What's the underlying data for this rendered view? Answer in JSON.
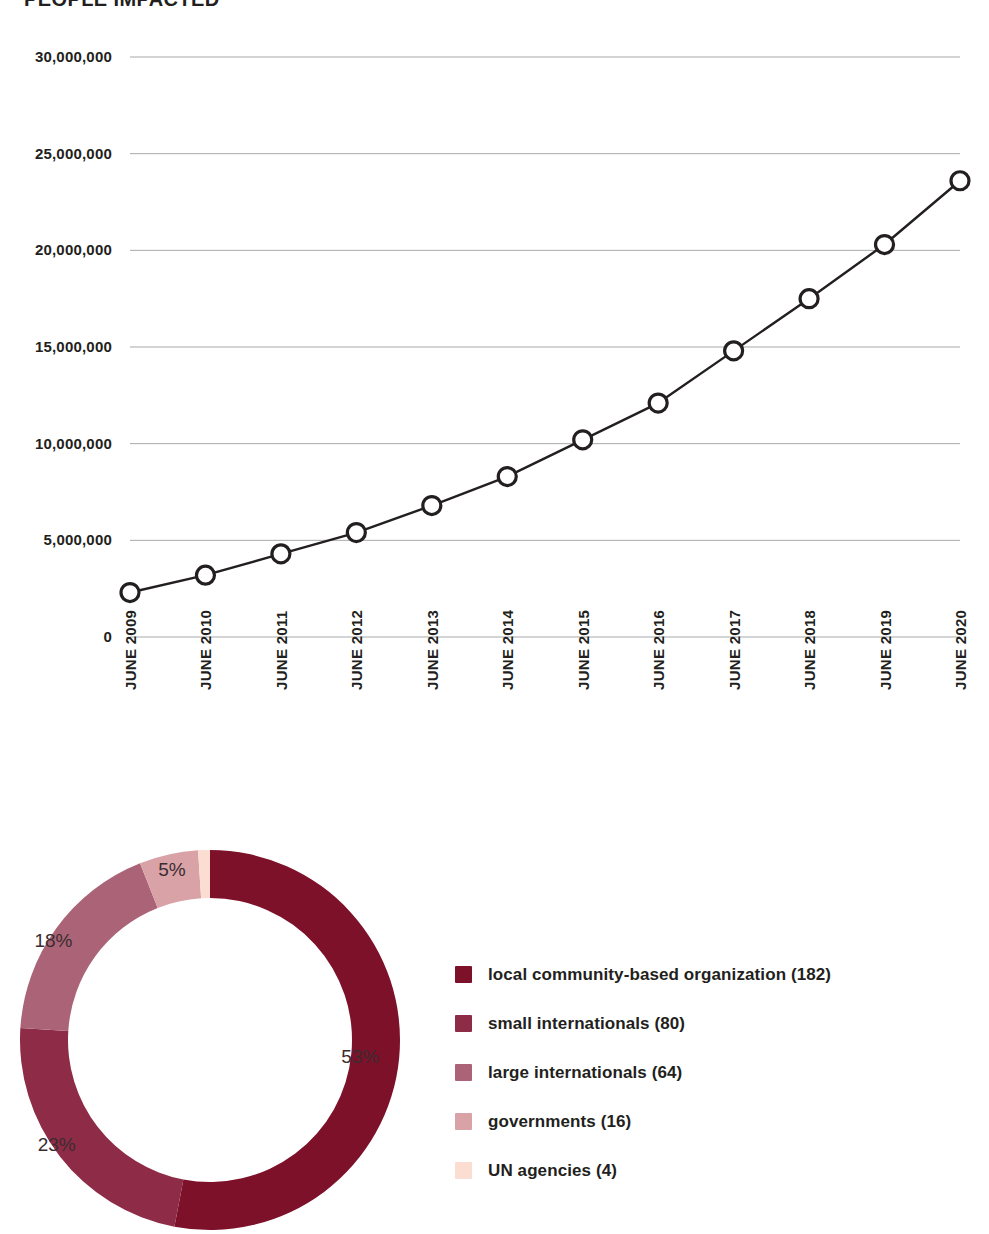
{
  "title": "PEOPLE IMPACTED",
  "chart_data": [
    {
      "type": "line",
      "title": "PEOPLE IMPACTED",
      "xlabel": "",
      "ylabel": "",
      "grid": true,
      "legend_position": "none",
      "ylim": [
        0,
        30000000
      ],
      "categories": [
        "JUNE 2009",
        "JUNE 2010",
        "JUNE 2011",
        "JUNE 2012",
        "JUNE 2013",
        "JUNE 2014",
        "JUNE 2015",
        "JUNE 2016",
        "JUNE 2017",
        "JUNE 2018",
        "JUNE 2019",
        "JUNE 2020"
      ],
      "ytick_labels": [
        "30,000,000",
        "25,000,000",
        "20,000,000",
        "15,000,000",
        "10,000,000",
        "5,000,000",
        "0"
      ],
      "ytick_values": [
        30000000,
        25000000,
        20000000,
        15000000,
        10000000,
        5000000,
        0
      ],
      "values": [
        2300000,
        3200000,
        4300000,
        5400000,
        6800000,
        8300000,
        10200000,
        12100000,
        14800000,
        17500000,
        20300000,
        23600000
      ],
      "marker": "open-circle",
      "line_color": "#231f20"
    },
    {
      "type": "pie",
      "variant": "donut",
      "title": "",
      "legend_position": "right",
      "labels": [
        "local community-based organization (182)",
        "small internationals (80)",
        "large internationals (64)",
        "governments (16)",
        "UN agencies (4)"
      ],
      "values": [
        182,
        80,
        64,
        16,
        4
      ],
      "percent_labels": [
        "53%",
        "23%",
        "18%",
        "5%",
        "1%"
      ],
      "percents": [
        53,
        23,
        18,
        5,
        1
      ],
      "colors": [
        "#7d1129",
        "#8e2b47",
        "#ab6477",
        "#d9a2a6",
        "#fbddd2"
      ]
    }
  ],
  "line_chart": {
    "ytick_labels": [
      "30,000,000",
      "25,000,000",
      "20,000,000",
      "15,000,000",
      "10,000,000",
      "5,000,000",
      "0"
    ],
    "xtick_labels": [
      "JUNE 2009",
      "JUNE 2010",
      "JUNE 2011",
      "JUNE 2012",
      "JUNE 2013",
      "JUNE 2014",
      "JUNE 2015",
      "JUNE 2016",
      "JUNE 2017",
      "JUNE 2018",
      "JUNE 2019",
      "JUNE 2020"
    ]
  },
  "donut": {
    "percent_labels": [
      "53%",
      "23%",
      "18%",
      "5%",
      "1%"
    ],
    "legend": [
      {
        "label": "local community-based organization (182)",
        "color": "#7d1129"
      },
      {
        "label": "small internationals (80)",
        "color": "#8e2b47"
      },
      {
        "label": "large internationals (64)",
        "color": "#ab6477"
      },
      {
        "label": "governments (16)",
        "color": "#d9a2a6"
      },
      {
        "label": "UN agencies (4)",
        "color": "#fbddd2"
      }
    ]
  },
  "colors": {
    "ink": "#231f20",
    "gridline": "#a7a9ac",
    "background": "#ffffff",
    "accent_dark": "#7d1129",
    "accent_light": "#fbddd2"
  }
}
